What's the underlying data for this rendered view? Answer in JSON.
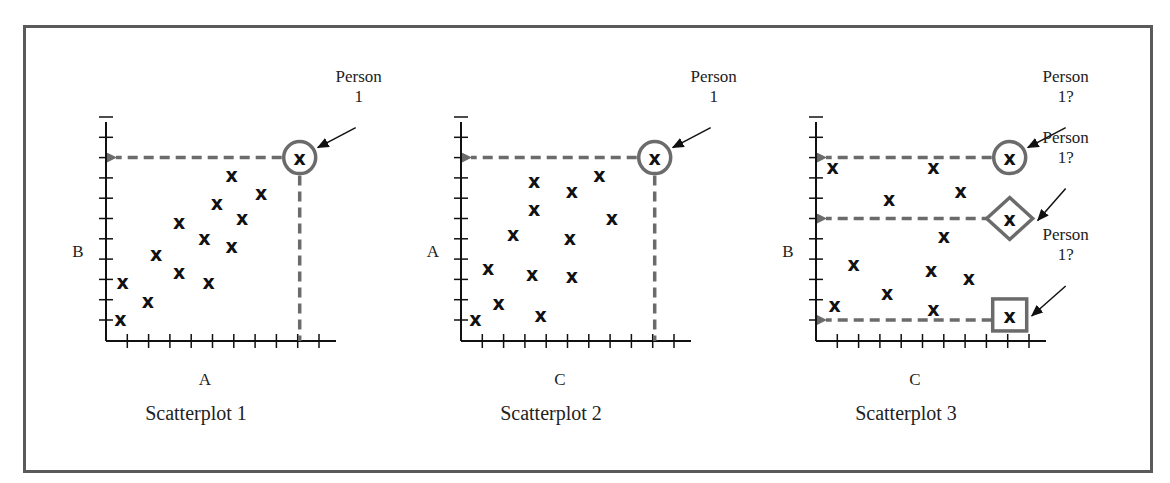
{
  "figure": {
    "frame_color": "#5a5a5a",
    "highlight_color": "#6b6b6b",
    "point_marker": "x",
    "axis_color": "#111111"
  },
  "chart_data": [
    {
      "type": "scatter",
      "title": "Scatterplot 1",
      "xlabel": "A",
      "ylabel": "B",
      "grid": false,
      "x_ticks": 10,
      "y_ticks": 10,
      "points": [
        [
          0.5,
          1.0
        ],
        [
          0.6,
          2.8
        ],
        [
          1.8,
          1.9
        ],
        [
          2.2,
          4.2
        ],
        [
          3.3,
          5.8
        ],
        [
          3.3,
          3.3
        ],
        [
          4.5,
          5.0
        ],
        [
          4.7,
          2.8
        ],
        [
          5.1,
          6.7
        ],
        [
          5.8,
          8.1
        ],
        [
          6.3,
          6.0
        ],
        [
          5.8,
          4.6
        ],
        [
          7.2,
          7.2
        ]
      ],
      "highlighted": [
        {
          "x": 9.0,
          "y": 9.0,
          "shape": "circle",
          "label_line1": "Person",
          "label_line2": "1",
          "guide_x": true,
          "guide_y": true
        }
      ]
    },
    {
      "type": "scatter",
      "title": "Scatterplot 2",
      "xlabel": "C",
      "ylabel": "A",
      "grid": false,
      "x_ticks": 10,
      "y_ticks": 10,
      "points": [
        [
          0.5,
          1.0
        ],
        [
          1.6,
          1.8
        ],
        [
          1.1,
          3.5
        ],
        [
          2.3,
          5.2
        ],
        [
          3.3,
          7.8
        ],
        [
          3.3,
          6.4
        ],
        [
          3.2,
          3.2
        ],
        [
          3.6,
          1.2
        ],
        [
          5.1,
          7.3
        ],
        [
          5.0,
          5.0
        ],
        [
          5.1,
          3.1
        ],
        [
          6.4,
          8.1
        ],
        [
          7.0,
          6.0
        ]
      ],
      "highlighted": [
        {
          "x": 9.0,
          "y": 9.0,
          "shape": "circle",
          "label_line1": "Person",
          "label_line2": "1",
          "guide_x": true,
          "guide_y": true
        }
      ]
    },
    {
      "type": "scatter",
      "title": "Scatterplot 3",
      "xlabel": "C",
      "ylabel": "B",
      "grid": false,
      "x_ticks": 10,
      "y_ticks": 10,
      "points": [
        [
          0.6,
          8.5
        ],
        [
          5.4,
          8.5
        ],
        [
          6.7,
          7.3
        ],
        [
          3.3,
          6.9
        ],
        [
          5.9,
          5.1
        ],
        [
          1.6,
          3.7
        ],
        [
          5.3,
          3.4
        ],
        [
          7.1,
          3.0
        ],
        [
          3.2,
          2.3
        ],
        [
          0.7,
          1.7
        ],
        [
          5.4,
          1.5
        ]
      ],
      "highlighted": [
        {
          "x": 9.0,
          "y": 9.0,
          "shape": "circle",
          "label_line1": "Person",
          "label_line2": "1?",
          "guide_x": false,
          "guide_y": true
        },
        {
          "x": 9.0,
          "y": 6.0,
          "shape": "diamond",
          "label_line1": "Person",
          "label_line2": "1?",
          "guide_x": false,
          "guide_y": true
        },
        {
          "x": 9.0,
          "y": 1.2,
          "shape": "square",
          "label_line1": "Person",
          "label_line2": "1?",
          "guide_x": false,
          "guide_y": true,
          "guide_y_level": 1.0
        }
      ]
    }
  ]
}
